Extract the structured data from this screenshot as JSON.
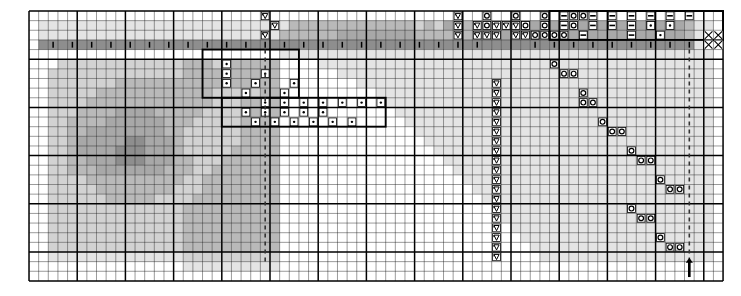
{
  "document": {
    "type": "cross-stitch-pattern-chart",
    "title": "Counted cross-stitch pattern chart",
    "description": "Monochrome grid chart, 72 columns by 28 rows, with shaded cells and stitch symbols"
  },
  "grid": {
    "columns": 72,
    "rows": 28,
    "cell_size": 9.64,
    "origin_x": 28,
    "origin_y": 10,
    "minor_line_color": "#1a1a1a",
    "major_line_color": "#000000",
    "major_every": 5,
    "background": "#ffffff"
  },
  "legend_symbols": [
    {
      "name": "heart-symbol",
      "glyph": "heart",
      "meaning": "backstitch-heart"
    },
    {
      "name": "circle-symbol",
      "glyph": "circle",
      "meaning": "open-circle-stitch"
    },
    {
      "name": "dot-symbol",
      "glyph": "dot",
      "meaning": "french-knot"
    },
    {
      "name": "dash-symbol",
      "glyph": "dash",
      "meaning": "horizontal-bar-stitch"
    },
    {
      "name": "bar-symbol",
      "glyph": "bar",
      "meaning": "vertical-bar-stitch"
    },
    {
      "name": "cross-symbol",
      "glyph": "cross",
      "meaning": "x-cross-stitch"
    }
  ],
  "shades": {
    "white": "#ffffff",
    "light": "#e4e4e4",
    "lightmid": "#d2d2d2",
    "mid": "#b9b9b9",
    "midnote": "#a8a8a8",
    "dark": "#8e8e8e",
    "darker": "#787878",
    "darkest": "#4a4a4a"
  },
  "markers": {
    "center_line": {
      "name": "center-dashed-line",
      "column": 24,
      "style": "dashed"
    },
    "right_line": {
      "name": "right-dashed-line",
      "column": 68,
      "style": "dashed"
    },
    "bottom_arrow": {
      "name": "bottom-center-arrow",
      "column": 68,
      "direction": "up"
    }
  },
  "chart_data": {
    "type": "heatmap",
    "xlabel": "",
    "ylabel": "",
    "columns": 72,
    "rows": 28,
    "palette": [
      "#ffffff",
      "#e4e4e4",
      "#d2d2d2",
      "#b9b9b9",
      "#a8a8a8",
      "#8e8e8e",
      "#787878",
      "#4a4a4a"
    ],
    "shade_rows": [
      "000000000000000000000000000000000000000000000000000000000000000000000000",
      "011111111111111111111111111333333333333323243334444444444444444444443110",
      "011111111111111111111111113333334444444433332334444444444444444444443110",
      "055555555555555555555555555555555555555555555555555555555555555555555110",
      "000000000000000000000000001111111111111111111111111111111111111111111110",
      "000222222222222233322333330000111111111111111111111111111111111111111110",
      "002222222222222233333333330000001111111111111111111111111111111111111110",
      "002222222333333333333333330000000011111111111111111111111111111111111110",
      "002222233333333333322222330000000000111111111111111111111111111111111110",
      "002222333333333333322233330000000000011111111111111111111111111111111110",
      "002223333444433333222233330000000000001111111111111111111111111111111110",
      "002233334444443332222233330000000000000111111111111111111111111111111110",
      "002233444444443322222233330000000000000011111111111111111111111111111110",
      "002234444455444322222233330000000000000001111111111111111111111111111110",
      "002234444555444322222333330000000000000000111111111111111111111111111110",
      "002233444555444332223333330000000000000000011111111111111111111111111110",
      "002233344444443332233333330000000000000000001111111111111111111111111110",
      "002222333333333322333333330000000000000000000111111111111111111111111110",
      "002222233333333222333333330000000000000000000011111111111111111111111110",
      "002222223333322223333333330000000000000000000001111111111111111111111110",
      "002222222222222233333333330000000000000000000000111111111111111111111110",
      "002222222222222233333333330000000000000000000000011111111111111111111110",
      "002222222222222233333333330000000000000000000000001111111111111111111110",
      "002222222222222233333333330000000000000000000000000111111111111111111110",
      "002222222222222233333333330000000000000000000000000011111111111111111110",
      "001111111111111122222222220000000000000000000000000001111111111111111110",
      "000000000000000011111111110000000000000000000000000000000000000000000000",
      "000000000000000000000000000000000000000000000000000000000000000000000000"
    ],
    "symbols": [
      {
        "sym": "heart",
        "cells": [
          [
            24,
            0
          ],
          [
            44,
            0
          ],
          [
            50,
            0
          ],
          [
            25,
            1
          ],
          [
            44,
            1
          ],
          [
            46,
            1
          ],
          [
            48,
            1
          ],
          [
            49,
            1
          ],
          [
            50,
            1
          ],
          [
            51,
            1
          ],
          [
            24,
            2
          ],
          [
            44,
            2
          ],
          [
            46,
            2
          ],
          [
            47,
            2
          ],
          [
            48,
            2
          ],
          [
            50,
            2
          ],
          [
            51,
            2
          ],
          [
            52,
            2
          ],
          [
            48,
            7
          ],
          [
            48,
            8
          ],
          [
            48,
            9
          ],
          [
            48,
            10
          ],
          [
            48,
            11
          ],
          [
            48,
            12
          ],
          [
            48,
            13
          ],
          [
            48,
            14
          ],
          [
            48,
            15
          ],
          [
            48,
            16
          ],
          [
            48,
            17
          ],
          [
            48,
            18
          ],
          [
            48,
            19
          ],
          [
            48,
            20
          ],
          [
            48,
            21
          ],
          [
            48,
            22
          ],
          [
            48,
            23
          ],
          [
            48,
            24
          ],
          [
            48,
            25
          ]
        ]
      },
      {
        "sym": "circle",
        "cells": [
          [
            47,
            0
          ],
          [
            53,
            0
          ],
          [
            50,
            0
          ],
          [
            51,
            1
          ],
          [
            47,
            1
          ],
          [
            53,
            1
          ],
          [
            52,
            2
          ],
          [
            53,
            2
          ],
          [
            54,
            2
          ],
          [
            56,
            0
          ],
          [
            57,
            0
          ],
          [
            56,
            1
          ],
          [
            55,
            2
          ],
          [
            57,
            2
          ],
          [
            54,
            5
          ],
          [
            55,
            6
          ],
          [
            56,
            6
          ],
          [
            57,
            8
          ],
          [
            57,
            9
          ],
          [
            58,
            9
          ],
          [
            59,
            11
          ],
          [
            60,
            12
          ],
          [
            61,
            12
          ],
          [
            62,
            14
          ],
          [
            63,
            15
          ],
          [
            64,
            15
          ],
          [
            65,
            17
          ],
          [
            66,
            18
          ],
          [
            67,
            18
          ],
          [
            62,
            20
          ],
          [
            63,
            21
          ],
          [
            64,
            21
          ],
          [
            65,
            23
          ],
          [
            66,
            24
          ],
          [
            67,
            24
          ]
        ]
      },
      {
        "sym": "dash",
        "cells": [
          [
            55,
            0
          ],
          [
            58,
            0
          ],
          [
            60,
            0
          ],
          [
            62,
            0
          ],
          [
            64,
            0
          ],
          [
            66,
            0
          ],
          [
            68,
            0
          ],
          [
            55,
            1
          ],
          [
            58,
            1
          ],
          [
            60,
            1
          ],
          [
            62,
            1
          ],
          [
            64,
            1
          ],
          [
            57,
            2
          ],
          [
            62,
            2
          ]
        ]
      },
      {
        "sym": "dot",
        "cells": [
          [
            64,
            1
          ],
          [
            66,
            1
          ],
          [
            65,
            2
          ],
          [
            20,
            5
          ],
          [
            20,
            6
          ],
          [
            24,
            6
          ],
          [
            20,
            7
          ],
          [
            23,
            7
          ],
          [
            27,
            7
          ],
          [
            22,
            8
          ],
          [
            26,
            8
          ],
          [
            24,
            9
          ],
          [
            26,
            9
          ],
          [
            28,
            9
          ],
          [
            30,
            9
          ],
          [
            32,
            9
          ],
          [
            34,
            9
          ],
          [
            36,
            9
          ],
          [
            22,
            10
          ],
          [
            24,
            10
          ],
          [
            26,
            10
          ],
          [
            28,
            10
          ],
          [
            30,
            10
          ],
          [
            23,
            11
          ],
          [
            25,
            11
          ],
          [
            27,
            11
          ],
          [
            29,
            11
          ],
          [
            31,
            11
          ],
          [
            33,
            11
          ]
        ]
      },
      {
        "sym": "cross",
        "cells": [
          [
            70,
            2
          ],
          [
            71,
            2
          ],
          [
            70,
            3
          ],
          [
            71,
            3
          ]
        ]
      },
      {
        "sym": "bar",
        "cells": [
          [
            2,
            3
          ],
          [
            4,
            3
          ],
          [
            6,
            3
          ],
          [
            8,
            3
          ],
          [
            10,
            3
          ],
          [
            12,
            3
          ],
          [
            14,
            3
          ],
          [
            16,
            3
          ],
          [
            18,
            3
          ],
          [
            20,
            3
          ],
          [
            22,
            3
          ],
          [
            24,
            3
          ],
          [
            26,
            3
          ],
          [
            28,
            3
          ],
          [
            30,
            3
          ],
          [
            32,
            3
          ],
          [
            34,
            3
          ],
          [
            36,
            3
          ],
          [
            38,
            3
          ],
          [
            40,
            3
          ],
          [
            42,
            3
          ],
          [
            44,
            3
          ],
          [
            46,
            3
          ],
          [
            52,
            3
          ],
          [
            54,
            3
          ],
          [
            56,
            3
          ],
          [
            58,
            3
          ],
          [
            60,
            3
          ],
          [
            62,
            3
          ],
          [
            64,
            3
          ],
          [
            66,
            3
          ],
          [
            68,
            3
          ]
        ]
      }
    ],
    "outlines": [
      {
        "name": "outline-top-left-block",
        "x": 18,
        "y": 4,
        "w": 10,
        "h": 5
      },
      {
        "name": "outline-dot-region",
        "x": 20,
        "y": 9,
        "w": 17,
        "h": 3
      },
      {
        "name": "outline-top-right-block",
        "x": 54,
        "y": 0,
        "w": 18,
        "h": 3
      }
    ]
  }
}
